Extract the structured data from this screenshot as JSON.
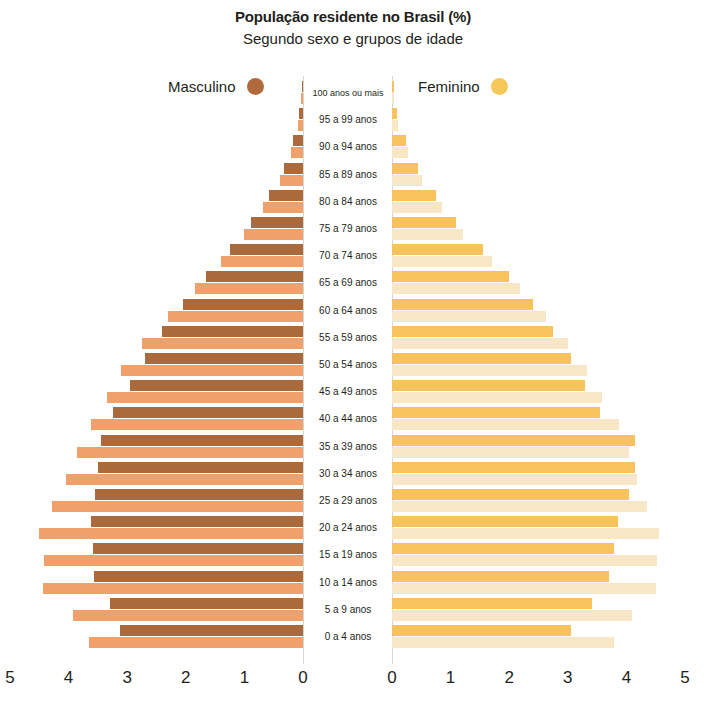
{
  "header": {
    "title": "População residente no Brasil (%)",
    "subtitle": "Segundo sexo e grupos de idade"
  },
  "legend": {
    "male_label": "Masculino",
    "female_label": "Feminino",
    "male_color": "#b06a3c",
    "female_color": "#f6c85a"
  },
  "colors": {
    "male_dark": "#ab6a3c",
    "male_light": "#f0a06a",
    "female_dark": "#f8c25c",
    "female_light": "#f7e7c6",
    "axis": "#d8d5d2",
    "text": "#231f20"
  },
  "chart_data": {
    "type": "bar",
    "subtype": "population-pyramid",
    "title": "População residente no Brasil (%)",
    "subtitle": "Segundo sexo e grupos de idade",
    "xlabel": "",
    "ylabel": "",
    "xlim": [
      0,
      5
    ],
    "xticks": [
      5,
      4,
      3,
      2,
      1,
      0,
      0,
      1,
      2,
      3,
      4,
      5
    ],
    "xticks_left": [
      5,
      4,
      3,
      2,
      1,
      0
    ],
    "xticks_right": [
      0,
      1,
      2,
      3,
      4,
      5
    ],
    "grid": false,
    "legend_position": "top",
    "categories": [
      "100 anos ou mais",
      "95 a 99 anos",
      "90 a 94 anos",
      "85 a 89 anos",
      "80 a 84 anos",
      "75 a 79 anos",
      "70 a 74 anos",
      "65 a 69 anos",
      "60 a 64 anos",
      "55 a 59 anos",
      "50 a 54 anos",
      "45 a 49 anos",
      "40 a 44 anos",
      "35 a 39 anos",
      "30 a 34 anos",
      "25 a 29 anos",
      "20 a 24 anos",
      "15 a 19 anos",
      "10 a 14 anos",
      "5 a 9 anos",
      "0 a 4 anos"
    ],
    "series": [
      {
        "name": "Masculino (escuro)",
        "side": "left",
        "color": "#ab6a3c",
        "values": [
          0.02,
          0.06,
          0.17,
          0.33,
          0.58,
          0.88,
          1.25,
          1.65,
          2.05,
          2.4,
          2.7,
          2.95,
          3.25,
          3.45,
          3.5,
          3.55,
          3.62,
          3.58,
          3.57,
          3.3,
          3.12
        ]
      },
      {
        "name": "Masculino (claro)",
        "side": "left",
        "color": "#f0a06a",
        "values": [
          0.03,
          0.08,
          0.2,
          0.4,
          0.68,
          1.0,
          1.4,
          1.85,
          2.3,
          2.75,
          3.1,
          3.35,
          3.62,
          3.85,
          4.05,
          4.28,
          4.5,
          4.42,
          4.43,
          3.92,
          3.65
        ]
      },
      {
        "name": "Feminino (escuro)",
        "side": "right",
        "color": "#f8c25c",
        "values": [
          0.03,
          0.09,
          0.24,
          0.45,
          0.75,
          1.1,
          1.55,
          2.0,
          2.4,
          2.75,
          3.05,
          3.3,
          3.55,
          4.15,
          4.15,
          4.05,
          3.85,
          3.78,
          3.7,
          3.42,
          3.05
        ]
      },
      {
        "name": "Feminino (claro)",
        "side": "right",
        "color": "#f7e7c6",
        "values": [
          0.04,
          0.1,
          0.28,
          0.52,
          0.85,
          1.22,
          1.7,
          2.18,
          2.62,
          3.0,
          3.32,
          3.58,
          3.88,
          4.05,
          4.18,
          4.35,
          4.55,
          4.52,
          4.5,
          4.1,
          3.78
        ]
      }
    ]
  }
}
